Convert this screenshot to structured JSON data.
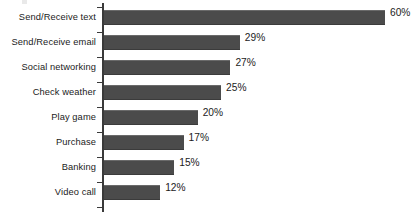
{
  "chart_data": {
    "type": "bar",
    "orientation": "horizontal",
    "title": "",
    "subtitle": "",
    "xlabel": "",
    "ylabel": "",
    "xlim": [
      0,
      60
    ],
    "grid": false,
    "legend": null,
    "value_suffix": "%",
    "categories": [
      "Send/Receive text",
      "Send/Receive email",
      "Social networking",
      "Check weather",
      "Play game",
      "Purchase",
      "Banking",
      "Video call"
    ],
    "values": [
      60,
      29,
      27,
      25,
      20,
      17,
      15,
      12
    ],
    "data_labels": [
      "60%",
      "29%",
      "27%",
      "25%",
      "20%",
      "17%",
      "15%",
      "12%"
    ],
    "bar_color": "#4b4b4b",
    "axis_color": "#3a3a3a",
    "background_color": "#ffffff",
    "text_color": "#1b1b1b"
  }
}
